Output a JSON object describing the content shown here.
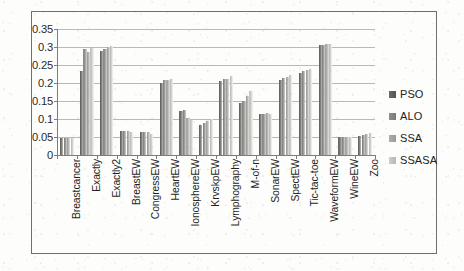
{
  "chart_data": {
    "type": "bar",
    "title": "",
    "subtitle": "",
    "xlabel": "",
    "ylabel": "",
    "ylim": [
      0,
      0.35
    ],
    "ytick_labels": [
      "0.35",
      "0.3",
      "0.25",
      "0.2",
      "0.15",
      "0.1",
      "0.05",
      "0"
    ],
    "ytick_values": [
      0.35,
      0.3,
      0.25,
      0.2,
      0.15,
      0.1,
      0.05,
      0
    ],
    "grid": true,
    "legend_position": "right",
    "categories": [
      "Breastcancer",
      "Exactly",
      "Exactly2",
      "BreastEW",
      "CongressEW",
      "HeartEW",
      "IonosphereEW",
      "KrvskpEW",
      "Lymphography",
      "M-of-n",
      "SonarEW",
      "SpectEW",
      "Tic-tac-toe",
      "WaveformEW",
      "WineEW",
      "Zoo"
    ],
    "series": [
      {
        "name": "PSO",
        "color": "#5e5e5c",
        "values": [
          0.047,
          0.234,
          0.288,
          0.066,
          0.063,
          0.2,
          0.122,
          0.084,
          0.205,
          0.144,
          0.113,
          0.208,
          0.228,
          0.305,
          0.049,
          0.054
        ]
      },
      {
        "name": "ALO",
        "color": "#7e7e7b",
        "values": [
          0.047,
          0.294,
          0.295,
          0.067,
          0.065,
          0.207,
          0.124,
          0.09,
          0.21,
          0.15,
          0.115,
          0.215,
          0.232,
          0.306,
          0.05,
          0.056
        ]
      },
      {
        "name": "SSA",
        "color": "#9b9b98",
        "values": [
          0.047,
          0.286,
          0.3,
          0.068,
          0.063,
          0.208,
          0.104,
          0.094,
          0.212,
          0.164,
          0.117,
          0.218,
          0.235,
          0.307,
          0.05,
          0.058
        ]
      },
      {
        "name": "SSASA",
        "color": "#bababa",
        "values": [
          0.046,
          0.296,
          0.303,
          0.064,
          0.057,
          0.212,
          0.097,
          0.101,
          0.219,
          0.178,
          0.114,
          0.221,
          0.24,
          0.308,
          0.051,
          0.06
        ]
      }
    ]
  }
}
